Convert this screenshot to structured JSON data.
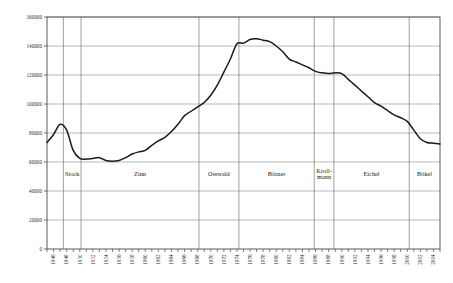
{
  "chart_data": {
    "type": "line",
    "title": "",
    "subtitle": "",
    "xlabel": "",
    "ylabel": "",
    "grid": true,
    "legend_position": "none",
    "xlim": [
      1945,
      2005
    ],
    "ylim": [
      0,
      160000
    ],
    "y_ticks": [
      0,
      20000,
      40000,
      60000,
      80000,
      100000,
      120000,
      140000,
      160000
    ],
    "y_tick_labels": [
      "0",
      "20000",
      "40000",
      "60000",
      "80000",
      "100000",
      "120000",
      "140000",
      "160000"
    ],
    "x_tick_labels": [
      "1946",
      "1948",
      "1950",
      "1952",
      "1954",
      "1956",
      "1958",
      "1960",
      "1962",
      "1964",
      "1966",
      "1968",
      "1970",
      "1972",
      "1974",
      "1976",
      "1978",
      "1980",
      "1982",
      "1984",
      "1986",
      "1988",
      "1990",
      "1992",
      "1994",
      "1996",
      "1998",
      "2000",
      "2002",
      "2004"
    ],
    "x_minor_ticks_every": 1,
    "x_label_every": 2,
    "series": [
      {
        "name": "value",
        "color": "#1a1a1a",
        "x": [
          1945,
          1946,
          1947,
          1948,
          1949,
          1950,
          1951,
          1952,
          1953,
          1954,
          1955,
          1956,
          1957,
          1958,
          1959,
          1960,
          1961,
          1962,
          1963,
          1964,
          1965,
          1966,
          1967,
          1968,
          1969,
          1970,
          1971,
          1972,
          1973,
          1974,
          1975,
          1976,
          1977,
          1978,
          1979,
          1980,
          1981,
          1982,
          1983,
          1984,
          1985,
          1986,
          1987,
          1988,
          1989,
          1990,
          1991,
          1992,
          1993,
          1994,
          1995,
          1996,
          1997,
          1998,
          1999,
          2000,
          2001,
          2002,
          2003,
          2004,
          2005
        ],
        "values": [
          73500,
          79000,
          86000,
          82000,
          68000,
          62500,
          62000,
          62500,
          63000,
          61000,
          60500,
          61000,
          63000,
          65500,
          67000,
          68000,
          71500,
          74500,
          77000,
          81000,
          86000,
          92000,
          95000,
          98000,
          101000,
          106000,
          113000,
          122000,
          131000,
          141500,
          142000,
          144500,
          145000,
          144000,
          143000,
          140000,
          136000,
          131000,
          129000,
          127000,
          125000,
          122500,
          121500,
          121000,
          121500,
          121000,
          117000,
          113000,
          109000,
          105000,
          101000,
          98500,
          95500,
          92500,
          90500,
          88000,
          82000,
          76000,
          73500,
          73000,
          72500
        ]
      }
    ],
    "annotations": {
      "period_bands": [
        {
          "label": "Stock",
          "start_year": 1947.5,
          "end_year": 1950.2
        },
        {
          "label": "Zinn",
          "start_year": 1950.2,
          "end_year": 1968.2
        },
        {
          "label": "Osswald",
          "start_year": 1968.2,
          "end_year": 1974.3
        },
        {
          "label": "Börner",
          "start_year": 1974.3,
          "end_year": 1985.8
        },
        {
          "label": "Kroll-\nmann",
          "start_year": 1985.8,
          "end_year": 1988.8
        },
        {
          "label": "Eichel",
          "start_year": 1988.8,
          "end_year": 2000.3
        },
        {
          "label": "Bökel",
          "start_year": 2000.3,
          "end_year": 2005
        }
      ]
    }
  },
  "colors": {
    "line": "#1a1a1a",
    "grid": "#8a8a8a",
    "axis": "#4a4a4a",
    "separator": "#777777",
    "background": "#ffffff",
    "text": "#1a1a1a"
  }
}
